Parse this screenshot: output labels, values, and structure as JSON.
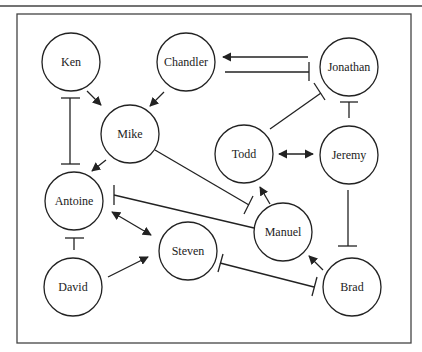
{
  "diagram": {
    "type": "network",
    "nodes": [
      {
        "id": "ken",
        "label": "Ken",
        "x": 71,
        "y": 62
      },
      {
        "id": "chandler",
        "label": "Chandler",
        "x": 186,
        "y": 62
      },
      {
        "id": "jonathan",
        "label": "Jonathan",
        "x": 349,
        "y": 67
      },
      {
        "id": "mike",
        "label": "Mike",
        "x": 130,
        "y": 134
      },
      {
        "id": "todd",
        "label": "Todd",
        "x": 244,
        "y": 154
      },
      {
        "id": "jeremy",
        "label": "Jeremy",
        "x": 349,
        "y": 155
      },
      {
        "id": "antoine",
        "label": "Antoine",
        "x": 74,
        "y": 201
      },
      {
        "id": "manuel",
        "label": "Manuel",
        "x": 283,
        "y": 232
      },
      {
        "id": "steven",
        "label": "Steven",
        "x": 188,
        "y": 251
      },
      {
        "id": "david",
        "label": "David",
        "x": 73,
        "y": 287
      },
      {
        "id": "brad",
        "label": "Brad",
        "x": 352,
        "y": 287
      }
    ],
    "edges": [
      {
        "from": "ken",
        "to": "mike",
        "type": "activation"
      },
      {
        "from": "chandler",
        "to": "mike",
        "type": "activation"
      },
      {
        "from": "ken",
        "to": "antoine",
        "type": "mutual-inhibition"
      },
      {
        "from": "mike",
        "to": "antoine",
        "type": "activation"
      },
      {
        "from": "jonathan",
        "to": "chandler",
        "type": "activation"
      },
      {
        "from": "chandler",
        "to": "jonathan",
        "type": "inhibition"
      },
      {
        "from": "todd",
        "to": "jonathan",
        "type": "inhibition"
      },
      {
        "from": "jeremy",
        "to": "jonathan",
        "type": "inhibition"
      },
      {
        "from": "todd",
        "to": "jeremy",
        "type": "bidirectional-activation"
      },
      {
        "from": "mike",
        "to": "manuel",
        "type": "inhibition"
      },
      {
        "from": "manuel",
        "to": "antoine",
        "type": "inhibition"
      },
      {
        "from": "manuel",
        "to": "todd",
        "type": "activation"
      },
      {
        "from": "jeremy",
        "to": "brad",
        "type": "inhibition"
      },
      {
        "from": "brad",
        "to": "manuel",
        "type": "activation"
      },
      {
        "from": "antoine",
        "to": "steven",
        "type": "bidirectional-activation"
      },
      {
        "from": "david",
        "to": "antoine",
        "type": "inhibition"
      },
      {
        "from": "david",
        "to": "steven",
        "type": "activation"
      },
      {
        "from": "brad",
        "to": "steven",
        "type": "mutual-inhibition"
      }
    ],
    "node_radius": 29,
    "colors": {
      "stroke": "#222222",
      "background": "#ffffff",
      "frame": "#444444"
    }
  }
}
